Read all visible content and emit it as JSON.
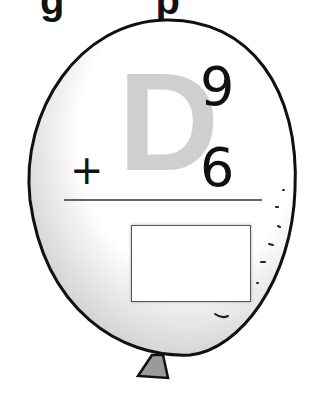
{
  "header": {
    "partial_text": "g p"
  },
  "problem": {
    "letter": "D",
    "top_number": "9",
    "operator": "+",
    "bottom_number": "6",
    "answer": ""
  },
  "colors": {
    "letter": "#cfcfcf",
    "outline": "#111111",
    "knot": "#9a9a9a"
  }
}
